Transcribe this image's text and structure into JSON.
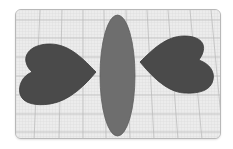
{
  "scene": {
    "workplane": {
      "background": "#ececec",
      "border": "#b8b8b8",
      "minor_grid_color": "#d6d6d6",
      "major_grid_color": "#b4b4b4"
    },
    "shapes": [
      {
        "id": "heart-left",
        "type": "heart",
        "fill": "#4a4a4a",
        "stroke": "#3a3a3a"
      },
      {
        "id": "ellipse-center",
        "type": "ellipse",
        "fill": "#6e6e6e",
        "stroke": "#5e5e5e"
      },
      {
        "id": "heart-right",
        "type": "heart",
        "fill": "#4a4a4a",
        "stroke": "#3a3a3a"
      }
    ]
  }
}
